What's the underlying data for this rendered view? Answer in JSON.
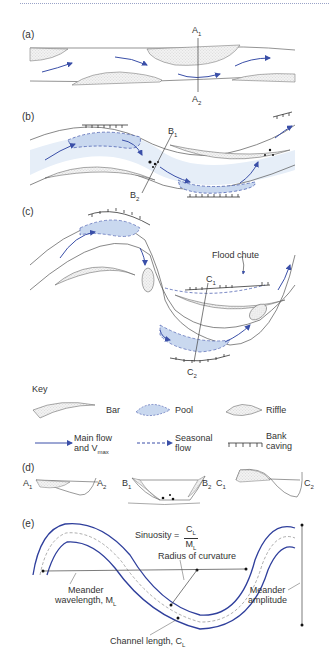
{
  "panels": {
    "a": {
      "label": "(a)",
      "section_top": "A",
      "section_top_sub": "1",
      "section_bottom": "A",
      "section_bottom_sub": "2"
    },
    "b": {
      "label": "(b)",
      "section_top": "B",
      "section_top_sub": "1",
      "section_bottom": "B",
      "section_bottom_sub": "2"
    },
    "c": {
      "label": "(c)",
      "section_top": "C",
      "section_top_sub": "1",
      "section_bottom": "C",
      "section_bottom_sub": "2",
      "annotation": "Flood chute"
    },
    "d": {
      "label": "(d)",
      "sections": [
        {
          "left": "A",
          "left_sub": "1",
          "right": "A",
          "right_sub": "2"
        },
        {
          "left": "B",
          "left_sub": "1",
          "right": "B",
          "right_sub": "2"
        },
        {
          "left": "C",
          "left_sub": "1",
          "right": "C",
          "right_sub": "2"
        }
      ]
    },
    "e": {
      "label": "(e)",
      "sinuosity_label": "Sinuosity =",
      "sinuosity_num": "C",
      "sinuosity_num_sub": "L",
      "sinuosity_den": "M",
      "sinuosity_den_sub": "L",
      "radius_label": "Radius of curvature",
      "wavelength_line1": "Meander",
      "wavelength_line2": "wavelength, M",
      "wavelength_sub": "L",
      "amplitude_line1": "Meander",
      "amplitude_line2": "amplitude",
      "channel_length": "Channel length, C",
      "channel_length_sub": "L"
    }
  },
  "key": {
    "title": "Key",
    "items": [
      {
        "icon": "bar-icon",
        "label": "Bar"
      },
      {
        "icon": "pool-icon",
        "label": "Pool"
      },
      {
        "icon": "riffle-icon",
        "label": "Riffle"
      },
      {
        "icon": "main-flow-arrow-icon",
        "label_line1": "Main flow",
        "label_line2": "and V",
        "label_sub": "max"
      },
      {
        "icon": "seasonal-flow-arrow-icon",
        "label_line1": "Seasonal",
        "label_line2": "flow"
      },
      {
        "icon": "bank-caving-icon",
        "label_line1": "Bank",
        "label_line2": "caving"
      }
    ]
  },
  "colors": {
    "flow": "#3a4fa8",
    "pool": "#c9d8ef",
    "channel_tint": "#e6eef8",
    "line": "#555555",
    "meander": "#2f3f9c"
  }
}
